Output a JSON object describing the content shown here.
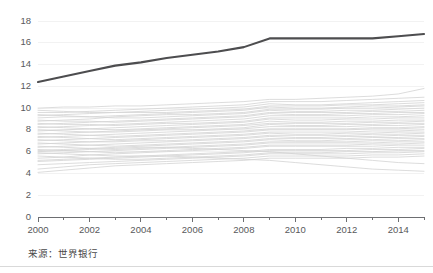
{
  "footer": {
    "source_note": "来源：世界银行"
  },
  "chart_data": {
    "type": "line",
    "title": "",
    "subtitle": "",
    "xlabel": "",
    "ylabel": "",
    "xlim": [
      2000,
      2015
    ],
    "ylim": [
      0,
      18
    ],
    "ytick_step": 2,
    "grid": true,
    "legend": "none",
    "annotations": [],
    "ytick_labels": [
      "0",
      "2",
      "4",
      "6",
      "8",
      "10",
      "12",
      "14",
      "16",
      "18"
    ],
    "ytick_values": [
      0,
      2,
      4,
      6,
      8,
      10,
      12,
      14,
      16,
      18
    ],
    "xtick_labels": [
      "2000",
      "2002",
      "2004",
      "2006",
      "2008",
      "2010",
      "2012",
      "2014"
    ],
    "xtick_values": [
      2000,
      2002,
      2004,
      2006,
      2008,
      2010,
      2012,
      2014
    ],
    "xminor_values": [
      2001,
      2003,
      2005,
      2007,
      2009,
      2011,
      2013,
      2015
    ],
    "x": [
      2000,
      2001,
      2002,
      2003,
      2004,
      2005,
      2006,
      2007,
      2008,
      2009,
      2010,
      2011,
      2012,
      2013,
      2014,
      2015
    ],
    "highlight_color": "#4d4d4f",
    "background_series_color": "#d4d4d4",
    "series": [
      {
        "name": "highlight",
        "highlight": true,
        "values": [
          12.4,
          12.9,
          13.4,
          13.9,
          14.2,
          14.6,
          14.9,
          15.2,
          15.6,
          16.4,
          16.4,
          16.4,
          16.4,
          16.4,
          16.6,
          16.8
        ]
      },
      {
        "name": "bg01",
        "highlight": false,
        "values": [
          10.0,
          10.1,
          10.1,
          10.2,
          10.2,
          10.3,
          10.4,
          10.5,
          10.6,
          10.8,
          10.8,
          10.9,
          11.0,
          11.1,
          11.3,
          11.8
        ]
      },
      {
        "name": "bg02",
        "highlight": false,
        "values": [
          9.6,
          9.6,
          9.7,
          9.8,
          9.9,
          10.0,
          10.1,
          10.2,
          10.3,
          10.6,
          10.6,
          10.6,
          10.7,
          10.8,
          10.9,
          11.0
        ]
      },
      {
        "name": "bg03",
        "highlight": false,
        "values": [
          9.8,
          9.7,
          9.6,
          9.6,
          9.7,
          9.8,
          9.9,
          10.0,
          10.1,
          10.4,
          10.3,
          10.3,
          10.4,
          10.5,
          10.6,
          10.7
        ]
      },
      {
        "name": "bg04",
        "highlight": false,
        "values": [
          9.3,
          9.4,
          9.5,
          9.6,
          9.6,
          9.6,
          9.7,
          9.8,
          9.9,
          10.2,
          10.2,
          10.2,
          10.3,
          10.3,
          10.4,
          10.5
        ]
      },
      {
        "name": "bg05",
        "highlight": false,
        "values": [
          9.1,
          9.2,
          9.2,
          9.3,
          9.4,
          9.5,
          9.6,
          9.7,
          9.8,
          10.1,
          10.0,
          10.0,
          10.1,
          10.2,
          10.2,
          10.3
        ]
      },
      {
        "name": "bg06",
        "highlight": false,
        "values": [
          8.8,
          8.9,
          9.0,
          9.2,
          9.3,
          9.4,
          9.4,
          9.5,
          9.6,
          9.9,
          9.9,
          9.9,
          10.0,
          10.0,
          10.1,
          10.2
        ]
      },
      {
        "name": "bg07",
        "highlight": false,
        "values": [
          9.4,
          9.3,
          9.2,
          9.1,
          9.1,
          9.2,
          9.3,
          9.4,
          9.5,
          9.8,
          9.7,
          9.7,
          9.8,
          9.8,
          9.9,
          10.0
        ]
      },
      {
        "name": "bg08",
        "highlight": false,
        "values": [
          8.5,
          8.6,
          8.7,
          8.8,
          8.9,
          9.0,
          9.1,
          9.2,
          9.3,
          9.6,
          9.6,
          9.6,
          9.6,
          9.7,
          9.7,
          9.8
        ]
      },
      {
        "name": "bg09",
        "highlight": false,
        "values": [
          8.9,
          8.8,
          8.8,
          8.7,
          8.8,
          8.9,
          9.0,
          9.1,
          9.2,
          9.5,
          9.4,
          9.4,
          9.5,
          9.5,
          9.6,
          9.6
        ]
      },
      {
        "name": "bg10",
        "highlight": false,
        "values": [
          8.2,
          8.3,
          8.4,
          8.5,
          8.6,
          8.7,
          8.8,
          8.9,
          9.0,
          9.3,
          9.3,
          9.3,
          9.3,
          9.4,
          9.4,
          9.5
        ]
      },
      {
        "name": "bg11",
        "highlight": false,
        "values": [
          8.6,
          8.5,
          8.5,
          8.4,
          8.5,
          8.6,
          8.6,
          8.7,
          8.8,
          9.1,
          9.1,
          9.1,
          9.1,
          9.2,
          9.2,
          9.3
        ]
      },
      {
        "name": "bg12",
        "highlight": false,
        "values": [
          7.9,
          8.0,
          8.1,
          8.2,
          8.3,
          8.4,
          8.5,
          8.6,
          8.7,
          9.0,
          8.9,
          8.9,
          9.0,
          9.0,
          9.1,
          9.1
        ]
      },
      {
        "name": "bg13",
        "highlight": false,
        "values": [
          8.3,
          8.2,
          8.1,
          8.0,
          8.1,
          8.2,
          8.3,
          8.4,
          8.5,
          8.8,
          8.7,
          8.7,
          8.8,
          8.8,
          8.9,
          8.9
        ]
      },
      {
        "name": "bg14",
        "highlight": false,
        "values": [
          7.6,
          7.7,
          7.8,
          7.9,
          8.0,
          8.1,
          8.2,
          8.3,
          8.4,
          8.6,
          8.6,
          8.6,
          8.6,
          8.7,
          8.7,
          8.8
        ]
      },
      {
        "name": "bg15",
        "highlight": false,
        "values": [
          8.0,
          7.9,
          7.8,
          7.8,
          7.9,
          8.0,
          8.0,
          8.1,
          8.2,
          8.5,
          8.4,
          8.4,
          8.5,
          8.5,
          8.6,
          8.6
        ]
      },
      {
        "name": "bg16",
        "highlight": false,
        "values": [
          7.3,
          7.4,
          7.5,
          7.6,
          7.7,
          7.8,
          7.9,
          8.0,
          8.1,
          8.3,
          8.3,
          8.3,
          8.3,
          8.4,
          8.4,
          8.5
        ]
      },
      {
        "name": "bg17",
        "highlight": false,
        "values": [
          7.7,
          7.6,
          7.5,
          7.4,
          7.5,
          7.6,
          7.7,
          7.8,
          7.9,
          8.1,
          8.1,
          8.1,
          8.1,
          8.2,
          8.2,
          8.3
        ]
      },
      {
        "name": "bg18",
        "highlight": false,
        "values": [
          7.0,
          7.1,
          7.2,
          7.3,
          7.4,
          7.5,
          7.6,
          7.7,
          7.8,
          8.0,
          8.0,
          8.0,
          8.0,
          8.1,
          8.1,
          8.2
        ]
      },
      {
        "name": "bg19",
        "highlight": false,
        "values": [
          7.4,
          7.3,
          7.2,
          7.1,
          7.2,
          7.3,
          7.4,
          7.5,
          7.6,
          7.8,
          7.8,
          7.8,
          7.8,
          7.9,
          7.9,
          8.0
        ]
      },
      {
        "name": "bg20",
        "highlight": false,
        "values": [
          6.7,
          6.8,
          6.9,
          7.0,
          7.1,
          7.2,
          7.3,
          7.4,
          7.5,
          7.7,
          7.6,
          7.6,
          7.7,
          7.7,
          7.8,
          7.8
        ]
      },
      {
        "name": "bg21",
        "highlight": false,
        "values": [
          7.1,
          7.0,
          6.9,
          6.9,
          7.0,
          7.0,
          7.1,
          7.2,
          7.3,
          7.5,
          7.5,
          7.5,
          7.5,
          7.6,
          7.6,
          7.7
        ]
      },
      {
        "name": "bg22",
        "highlight": false,
        "values": [
          6.4,
          6.5,
          6.6,
          6.7,
          6.8,
          6.9,
          7.0,
          7.1,
          7.2,
          7.4,
          7.3,
          7.3,
          7.4,
          7.4,
          7.5,
          7.5
        ]
      },
      {
        "name": "bg23",
        "highlight": false,
        "values": [
          6.8,
          6.7,
          6.6,
          6.5,
          6.6,
          6.7,
          6.8,
          6.9,
          7.0,
          7.2,
          7.2,
          7.2,
          7.2,
          7.3,
          7.3,
          7.4
        ]
      },
      {
        "name": "bg24",
        "highlight": false,
        "values": [
          6.1,
          6.2,
          6.3,
          6.4,
          6.5,
          6.6,
          6.7,
          6.8,
          6.9,
          7.1,
          7.0,
          7.0,
          7.1,
          7.1,
          7.2,
          7.2
        ]
      },
      {
        "name": "bg25",
        "highlight": false,
        "values": [
          6.5,
          6.4,
          6.3,
          6.2,
          6.3,
          6.4,
          6.5,
          6.6,
          6.7,
          6.9,
          6.9,
          6.9,
          6.9,
          7.0,
          7.0,
          7.1
        ]
      },
      {
        "name": "bg26",
        "highlight": false,
        "values": [
          5.8,
          5.9,
          6.0,
          6.1,
          6.2,
          6.3,
          6.4,
          6.5,
          6.6,
          6.8,
          6.8,
          6.8,
          6.8,
          6.8,
          6.9,
          6.9
        ]
      },
      {
        "name": "bg27",
        "highlight": false,
        "values": [
          6.2,
          6.1,
          6.0,
          5.9,
          6.0,
          6.1,
          6.2,
          6.3,
          6.4,
          6.6,
          6.6,
          6.6,
          6.6,
          6.7,
          6.7,
          6.8
        ]
      },
      {
        "name": "bg28",
        "highlight": false,
        "values": [
          5.4,
          5.5,
          5.7,
          5.8,
          5.9,
          6.0,
          6.1,
          6.2,
          6.3,
          6.5,
          6.5,
          6.5,
          6.5,
          6.5,
          6.6,
          6.6
        ]
      },
      {
        "name": "bg29",
        "highlight": false,
        "values": [
          5.9,
          5.8,
          5.7,
          5.6,
          5.6,
          5.7,
          5.8,
          5.9,
          6.0,
          6.2,
          6.2,
          6.2,
          6.3,
          6.3,
          6.4,
          6.4
        ]
      },
      {
        "name": "bg30",
        "highlight": false,
        "values": [
          5.1,
          5.2,
          5.3,
          5.4,
          5.5,
          5.6,
          5.7,
          5.8,
          5.9,
          6.1,
          6.1,
          6.1,
          6.1,
          6.2,
          6.2,
          6.3
        ]
      },
      {
        "name": "bg31",
        "highlight": false,
        "values": [
          5.6,
          5.5,
          5.4,
          5.3,
          5.3,
          5.4,
          5.5,
          5.6,
          5.7,
          5.9,
          5.9,
          5.9,
          6.0,
          6.0,
          6.1,
          6.1
        ]
      },
      {
        "name": "bg32",
        "highlight": false,
        "values": [
          4.8,
          4.9,
          5.0,
          5.1,
          5.2,
          5.3,
          5.4,
          5.5,
          5.6,
          5.8,
          5.8,
          5.8,
          5.8,
          5.9,
          5.9,
          6.0
        ]
      },
      {
        "name": "bg33",
        "highlight": false,
        "values": [
          4.4,
          4.6,
          4.8,
          4.9,
          5.0,
          5.1,
          5.2,
          5.3,
          5.4,
          5.6,
          5.6,
          5.6,
          5.6,
          5.7,
          5.7,
          5.8
        ]
      },
      {
        "name": "bg34",
        "highlight": false,
        "values": [
          4.1,
          4.3,
          4.5,
          4.7,
          4.8,
          4.9,
          5.0,
          5.1,
          5.2,
          5.4,
          5.4,
          5.4,
          5.4,
          5.5,
          5.5,
          5.6
        ]
      },
      {
        "name": "bg35",
        "highlight": false,
        "values": [
          5.2,
          5.3,
          5.4,
          5.5,
          5.6,
          5.6,
          5.5,
          5.4,
          5.3,
          5.2,
          5.0,
          4.8,
          4.6,
          4.4,
          4.3,
          4.2
        ]
      },
      {
        "name": "bg36",
        "highlight": false,
        "values": [
          6.0,
          6.1,
          6.2,
          6.3,
          6.4,
          6.4,
          6.3,
          6.2,
          6.1,
          6.0,
          5.8,
          5.6,
          5.4,
          5.2,
          5.0,
          4.9
        ]
      }
    ]
  }
}
